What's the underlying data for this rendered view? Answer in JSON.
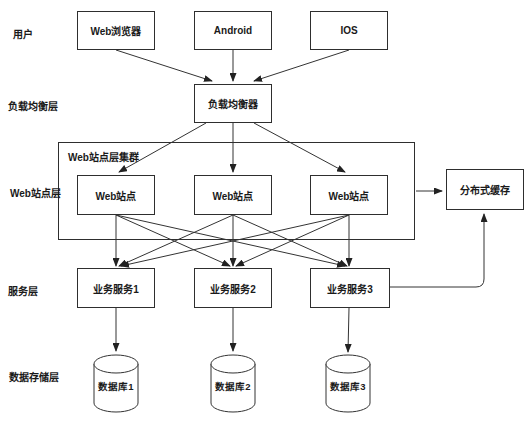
{
  "colors": {
    "background": "#ffffff",
    "line": "#333333",
    "text": "#1a1a1a"
  },
  "layer_labels": {
    "users": "用户",
    "load_balancer": "负载均衡层",
    "web": "Web站点层",
    "services": "服务层",
    "storage": "数据存储层"
  },
  "nodes": {
    "browser": "Web浏览器",
    "android": "Android",
    "ios": "IOS",
    "load_balancer": "负载均衡器",
    "cluster_title": "Web站点层集群",
    "web_sites": [
      "Web站点",
      "Web站点",
      "Web站点"
    ],
    "cache": "分布式缓存",
    "services": [
      "业务服务1",
      "业务服务2",
      "业务服务3"
    ],
    "databases": [
      "数据库1",
      "数据库2",
      "数据库3"
    ]
  }
}
